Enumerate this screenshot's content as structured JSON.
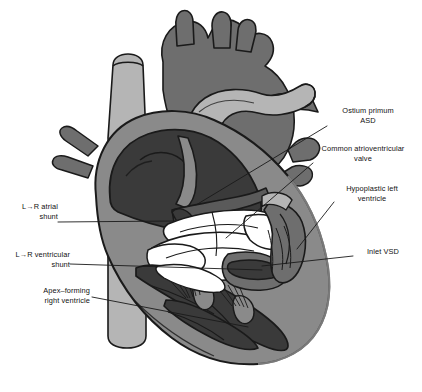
{
  "figure": {
    "type": "medical-illustration",
    "style": "grayscale line drawing, cutaway four-chamber view",
    "background_color": "#ffffff"
  },
  "palette": {
    "outline": "#1a1a1a",
    "chamber_dark": "#3a3a3a",
    "myocardium_mid": "#8a8a8a",
    "vessel_light": "#b5b5b5",
    "vessel_mid": "#6e6e6e",
    "valve_white": "#ffffff",
    "leader_line": "#1a1a1a"
  },
  "annotations": [
    {
      "id": "ostium-primum-asd",
      "side": "right",
      "lines": [
        "Ostium primum",
        "ASD"
      ],
      "text": "Ostium primum\nASD",
      "x": 330,
      "y": 107,
      "leader": {
        "x1": 327,
        "y1": 126,
        "x2": 196,
        "y2": 205
      }
    },
    {
      "id": "common-atrioventricular-valve",
      "side": "right",
      "lines": [
        "Common atrioventricular",
        "valve"
      ],
      "text": "Common atrioventricular\nvalve",
      "x": 313,
      "y": 145,
      "leader": {
        "x1": 313,
        "y1": 163,
        "x2": 226,
        "y2": 238
      }
    },
    {
      "id": "hypoplastic-left-ventricle",
      "side": "right",
      "lines": [
        "Hypoplastic left",
        "ventricle"
      ],
      "text": "Hypoplastic left",
      "x": 336,
      "y": 185,
      "leader": {
        "x1": 334,
        "y1": 202,
        "x2": 297,
        "y2": 249
      }
    },
    {
      "id": "inlet-vsd",
      "side": "right",
      "lines": [
        "Inlet VSD"
      ],
      "text": "Inlet VSD",
      "x": 356,
      "y": 249,
      "leader": {
        "x1": 353,
        "y1": 256,
        "x2": 262,
        "y2": 266
      }
    },
    {
      "id": "lr-atrial-shunt",
      "side": "left",
      "lines": [
        "L→R atrial",
        "shunt"
      ],
      "text": "L→R atrial\nshunt",
      "x": 10,
      "y": 202,
      "leader": {
        "x1": 58,
        "y1": 222,
        "x2": 174,
        "y2": 221
      }
    },
    {
      "id": "lr-ventricular-shunt",
      "side": "left",
      "lines": [
        "L→R ventricular",
        "shunt"
      ],
      "text": "L→R ventricular\nshunt",
      "x": 10,
      "y": 251,
      "leader": {
        "x1": 70,
        "y1": 264,
        "x2": 262,
        "y2": 270
      }
    },
    {
      "id": "apex-forming-right-ventricle",
      "side": "left",
      "lines": [
        "Apex–forming",
        "right ventricle"
      ],
      "text": "Apex–forming\nright ventricle",
      "x": 22,
      "y": 287,
      "leader": {
        "x1": 92,
        "y1": 297,
        "x2": 248,
        "y2": 327
      }
    }
  ]
}
